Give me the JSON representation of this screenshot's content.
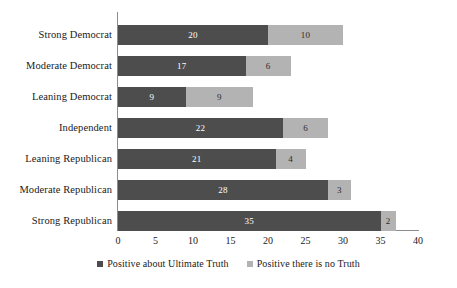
{
  "chart_data": {
    "type": "bar",
    "orientation": "horizontal",
    "stacked": true,
    "title": "",
    "xlabel": "",
    "ylabel": "",
    "xlim": [
      0,
      40
    ],
    "xticks": [
      0,
      5,
      10,
      15,
      20,
      25,
      30,
      35,
      40
    ],
    "xtick_labels": [
      "0",
      "5",
      "10",
      "15",
      "20",
      "25",
      "30",
      "35",
      "40"
    ],
    "grid": false,
    "legend_position": "bottom-center",
    "categories": [
      "Strong Democrat",
      "Moderate Democrat",
      "Leaning Democrat",
      "Independent",
      "Leaning Republican",
      "Moderate Republican",
      "Strong Republican"
    ],
    "series": [
      {
        "name": "Positive about Ultimate Truth",
        "color": "#4d4d4d",
        "values": [
          20,
          17,
          9,
          22,
          21,
          28,
          35
        ],
        "labels": [
          "20",
          "17",
          "9",
          "22",
          "21",
          "28",
          "35"
        ]
      },
      {
        "name": "Positive there is no Truth",
        "color": "#b3b3b3",
        "values": [
          10,
          6,
          9,
          6,
          4,
          3,
          2
        ],
        "labels": [
          "10",
          "6",
          "9",
          "6",
          "4",
          "3",
          "2"
        ]
      }
    ],
    "totals": [
      30,
      23,
      18,
      28,
      25,
      31,
      37
    ]
  },
  "legend": {
    "items": [
      {
        "label": "Positive about Ultimate Truth",
        "color": "#4d4d4d",
        "swatch_name": "legend-swatch-series-a"
      },
      {
        "label": "Positive there is no Truth",
        "color": "#b3b3b3",
        "swatch_name": "legend-swatch-series-b"
      }
    ]
  },
  "axes": {
    "x_axis_color": "#8c8c8c",
    "y_axis_color": "#8c8c8c"
  }
}
